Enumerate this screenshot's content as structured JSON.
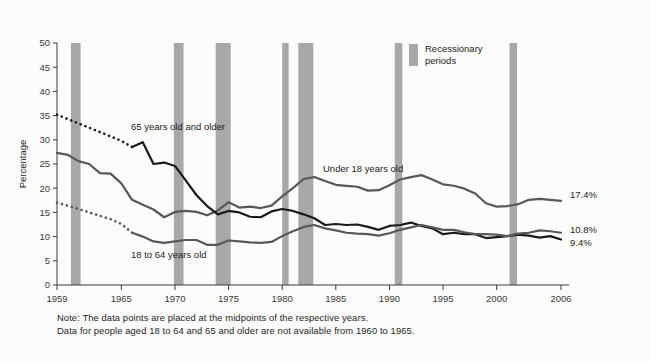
{
  "chart_data": {
    "type": "line",
    "title": "",
    "xlabel": "",
    "ylabel": "Percentage",
    "xlim": [
      1959,
      2006
    ],
    "ylim": [
      0,
      50
    ],
    "ytick_step": 5,
    "grid": false,
    "legend_position": "inside-top-right",
    "xticks": [
      "1959",
      "1965",
      "1970",
      "1975",
      "1980",
      "1985",
      "1990",
      "1995",
      "2000",
      "2006"
    ],
    "xtick_values": [
      1959,
      1965,
      1970,
      1975,
      1980,
      1985,
      1990,
      1995,
      2000,
      2006
    ],
    "yticks": [
      "0",
      "5",
      "10",
      "15",
      "20",
      "25",
      "30",
      "35",
      "40",
      "45",
      "50"
    ],
    "ytick_values": [
      0,
      5,
      10,
      15,
      20,
      25,
      30,
      35,
      40,
      45,
      50
    ],
    "series": [
      {
        "name": "Under 18 years old",
        "label_text": "Under 18 years old",
        "end_label": "17.4%",
        "color": "#58585b",
        "style": "solid",
        "x": [
          1959,
          1960,
          1961,
          1962,
          1963,
          1964,
          1965,
          1966,
          1967,
          1968,
          1969,
          1970,
          1971,
          1972,
          1973,
          1974,
          1975,
          1976,
          1977,
          1978,
          1979,
          1980,
          1981,
          1982,
          1983,
          1984,
          1985,
          1986,
          1987,
          1988,
          1989,
          1990,
          1991,
          1992,
          1993,
          1994,
          1995,
          1996,
          1997,
          1998,
          1999,
          2000,
          2001,
          2002,
          2003,
          2004,
          2005,
          2006
        ],
        "values": [
          27.3,
          26.9,
          25.6,
          25.0,
          23.1,
          23.0,
          21.0,
          17.6,
          16.6,
          15.6,
          14.0,
          15.1,
          15.3,
          15.1,
          14.4,
          15.4,
          17.1,
          16.0,
          16.2,
          15.9,
          16.4,
          18.3,
          20.0,
          21.9,
          22.3,
          21.5,
          20.7,
          20.5,
          20.3,
          19.5,
          19.6,
          20.6,
          21.8,
          22.3,
          22.7,
          21.8,
          20.8,
          20.5,
          19.9,
          18.9,
          16.9,
          16.2,
          16.3,
          16.7,
          17.6,
          17.8,
          17.6,
          17.4
        ]
      },
      {
        "name": "65 years old and older",
        "label_text": "65 years old and older",
        "end_label": "9.4%",
        "color": "#1a1a1a",
        "style": "solid-with-dotted-start",
        "dotted_x": [
          1959,
          1960,
          1961,
          1962,
          1963,
          1964,
          1965,
          1966
        ],
        "dotted_values": [
          35.2,
          34.3,
          33.4,
          32.5,
          31.6,
          30.7,
          29.8,
          28.5
        ],
        "x": [
          1966,
          1967,
          1968,
          1969,
          1970,
          1971,
          1972,
          1973,
          1974,
          1975,
          1976,
          1977,
          1978,
          1979,
          1980,
          1981,
          1982,
          1983,
          1984,
          1985,
          1986,
          1987,
          1988,
          1989,
          1990,
          1991,
          1992,
          1993,
          1994,
          1995,
          1996,
          1997,
          1998,
          1999,
          2000,
          2001,
          2002,
          2003,
          2004,
          2005,
          2006
        ],
        "values": [
          28.5,
          29.5,
          25.0,
          25.3,
          24.6,
          21.6,
          18.6,
          16.3,
          14.6,
          15.3,
          15.0,
          14.1,
          14.0,
          15.2,
          15.7,
          15.3,
          14.6,
          13.8,
          12.4,
          12.6,
          12.4,
          12.5,
          12.0,
          11.4,
          12.2,
          12.4,
          12.9,
          12.2,
          11.7,
          10.5,
          10.8,
          10.5,
          10.5,
          9.7,
          9.9,
          10.1,
          10.4,
          10.2,
          9.8,
          10.1,
          9.4
        ]
      },
      {
        "name": "18 to 64 years old",
        "label_text": "18 to 64 years old",
        "end_label": "10.8%",
        "color": "#58585b",
        "style": "solid-with-dotted-start",
        "dotted_x": [
          1959,
          1960,
          1961,
          1962,
          1963,
          1964,
          1965,
          1966
        ],
        "dotted_values": [
          17.0,
          16.4,
          15.7,
          15.0,
          14.3,
          13.6,
          12.6,
          10.8
        ],
        "x": [
          1966,
          1967,
          1968,
          1969,
          1970,
          1971,
          1972,
          1973,
          1974,
          1975,
          1976,
          1977,
          1978,
          1979,
          1980,
          1981,
          1982,
          1983,
          1984,
          1985,
          1986,
          1987,
          1988,
          1989,
          1990,
          1991,
          1992,
          1993,
          1994,
          1995,
          1996,
          1997,
          1998,
          1999,
          2000,
          2001,
          2002,
          2003,
          2004,
          2005,
          2006
        ],
        "values": [
          10.8,
          10.0,
          9.0,
          8.7,
          9.0,
          9.3,
          9.3,
          8.3,
          8.3,
          9.2,
          9.0,
          8.8,
          8.7,
          8.9,
          10.1,
          11.1,
          12.0,
          12.4,
          11.7,
          11.3,
          10.8,
          10.6,
          10.5,
          10.2,
          10.7,
          11.4,
          11.9,
          12.4,
          11.9,
          11.4,
          11.4,
          10.9,
          10.5,
          10.5,
          10.4,
          10.1,
          10.6,
          10.8,
          11.3,
          11.1,
          10.8
        ]
      }
    ],
    "recession_bands": [
      {
        "start": 1960.3,
        "end": 1961.2
      },
      {
        "start": 1969.9,
        "end": 1970.8
      },
      {
        "start": 1973.8,
        "end": 1975.2
      },
      {
        "start": 1980.0,
        "end": 1980.6
      },
      {
        "start": 1981.5,
        "end": 1982.9
      },
      {
        "start": 1990.5,
        "end": 1991.2
      },
      {
        "start": 2001.2,
        "end": 2001.9
      }
    ],
    "recession_color": "#a7a8aa",
    "legend": {
      "swatch_color": "#a7a8aa",
      "line1": "Recessionary",
      "line2": "periods"
    },
    "notes": [
      "Note: The data points are placed at the midpoints of the respective years.",
      "Data for people aged 18 to 64 and 65 and older are not available from 1960 to 1965."
    ]
  }
}
